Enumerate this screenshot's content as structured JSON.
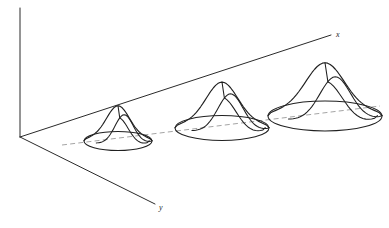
{
  "figure": {
    "title": "",
    "background_color": "#ffffff",
    "line_color": "#202020",
    "dash_color": "#9a9a9a",
    "width": 389,
    "height": 228
  },
  "axes": {
    "vertical": {
      "name": "vertical-axis",
      "x1": 20,
      "y1": 8,
      "x2": 20,
      "y2": 137
    },
    "x_axis": {
      "name": "x-axis",
      "label": "x",
      "x1": 20,
      "y1": 137,
      "x2": 331,
      "y2": 35,
      "label_x": 336,
      "label_y": 37
    },
    "y_axis": {
      "name": "y-axis",
      "label": "y",
      "x1": 20,
      "y1": 137,
      "x2": 155,
      "y2": 204,
      "label_x": 159,
      "label_y": 210
    }
  },
  "center_line": {
    "name": "mean-dashed-line",
    "x1": 62,
    "y1": 145,
    "x2": 380,
    "y2": 106,
    "style": "dashed"
  },
  "chart_data": {
    "type": "line",
    "title": "",
    "subtitle": "",
    "xlabel": "x",
    "ylabel": "",
    "zlabel": "",
    "grid": false,
    "legend": false,
    "axis_labels": [
      "x",
      "y"
    ],
    "series": [
      {
        "name": "gaussian-1",
        "center_x": 118,
        "center_y": 141,
        "base_rx": 34,
        "base_ry": 9.5,
        "peak_height": 30,
        "amplitude": 1,
        "sigma": 1
      },
      {
        "name": "gaussian-2",
        "center_x": 222,
        "center_y": 128,
        "base_rx": 47,
        "base_ry": 12.5,
        "peak_height": 39,
        "amplitude": 1.35,
        "sigma": 1.4
      },
      {
        "name": "gaussian-3",
        "center_x": 325,
        "center_y": 116,
        "base_rx": 57,
        "base_ry": 15,
        "peak_height": 45,
        "amplitude": 1.6,
        "sigma": 1.7
      }
    ]
  }
}
